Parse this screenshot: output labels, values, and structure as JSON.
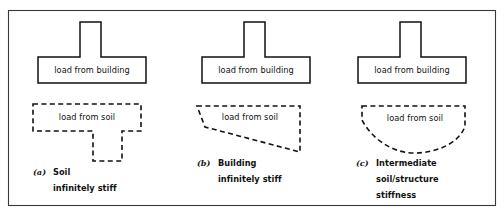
{
  "figure": {
    "type": "diagram",
    "border_color": "#3a3a3a",
    "line_color": "#111111",
    "background": "#ffffff",
    "width": 504,
    "height": 217
  },
  "panels": [
    {
      "id": "a",
      "index_label": "(a)",
      "building_label": "load from building",
      "soil_label": "load from soil",
      "caption_line1": "Soil",
      "caption_line2": "infinitely stiff",
      "caption_line3": "",
      "building_shape": "tee-block",
      "soil_shape": "stepped-tee-dashed",
      "soil_style": "dashed"
    },
    {
      "id": "b",
      "index_label": "(b)",
      "building_label": "load from building",
      "soil_label": "load from soil",
      "caption_line1": "Building",
      "caption_line2": "infinitely stiff",
      "caption_line3": "",
      "building_shape": "tee-block",
      "soil_shape": "trapezoid-dashed",
      "soil_style": "dashed"
    },
    {
      "id": "c",
      "index_label": "(c)",
      "building_label": "load from building",
      "soil_label": "load from soil",
      "caption_line1": "Intermediate",
      "caption_line2": "soil/structure",
      "caption_line3": "stiffness",
      "building_shape": "tee-block",
      "soil_shape": "curved-bowl-dashed",
      "soil_style": "dashed"
    }
  ]
}
